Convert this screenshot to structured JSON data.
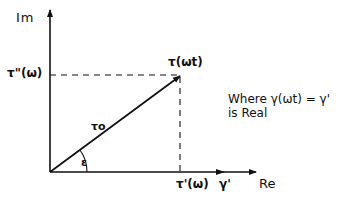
{
  "diagram": {
    "axes": {
      "imaginary_label": "Im",
      "real_label": "Re"
    },
    "labels": {
      "tau_double_prime": "τ\"(ω)",
      "tau_prime": "τ'(ω)",
      "gamma_prime": "γ'",
      "tau_vector": "τ(ωt)",
      "tau_magnitude": "τo",
      "angle": "ε"
    },
    "note": {
      "line1": "Where γ(ωt) = γ'",
      "line2": "is Real"
    },
    "colors": {
      "ink": "#111111",
      "background": "#ffffff"
    }
  }
}
